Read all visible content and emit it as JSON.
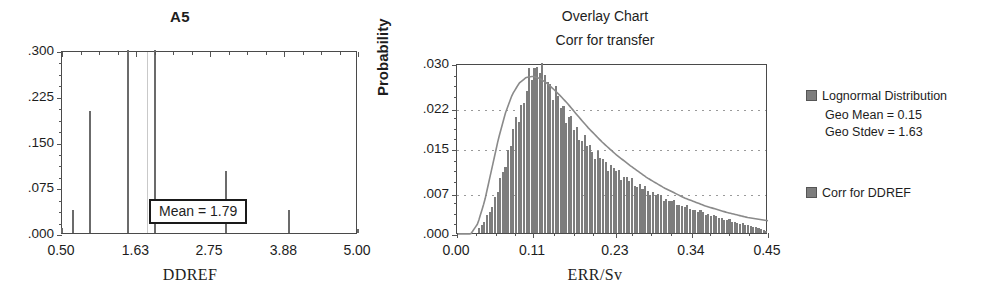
{
  "left_chart": {
    "title": "A5",
    "xlabel": "DDREF",
    "ytick_labels": [
      ".300",
      ".225",
      ".150",
      ".075",
      ".000"
    ],
    "xtick_labels": [
      "0.50",
      "1.63",
      "2.75",
      "3.88",
      "5.00"
    ],
    "annotation": "Mean = 1.79"
  },
  "right_chart": {
    "title": "Overlay Chart",
    "subtitle": "Corr for transfer",
    "ylabel": "Probability",
    "xlabel": "ERR/Sv",
    "ytick_labels": [
      ".030",
      ".022",
      ".015",
      ".007",
      ".000"
    ],
    "xtick_labels": [
      "0.00",
      "0.11",
      "0.23",
      "0.34",
      "0.45"
    ]
  },
  "legend": {
    "entry1_label": "Lognormal Distribution",
    "entry1_line2": "Geo Mean = 0.15",
    "entry1_line3": "Geo Stdev = 1.63",
    "entry2_label": "Corr for DDREF",
    "swatch_color": "#7d7d7d"
  },
  "chart_data": [
    {
      "type": "bar",
      "id": "A5-ddref",
      "title": "A5",
      "xlabel": "DDREF",
      "ylabel": "",
      "xlim": [
        0.5,
        5.0
      ],
      "ylim": [
        0.0,
        0.3
      ],
      "xticks": [
        0.5,
        1.63,
        2.75,
        3.88,
        5.0
      ],
      "yticks": [
        0.0,
        0.075,
        0.15,
        0.225,
        0.3
      ],
      "grid": false,
      "annotations": [
        "Mean = 1.79"
      ],
      "mean_line_x": 1.79,
      "categories": [
        0.5,
        0.67,
        0.92,
        1.5,
        1.92,
        3.0,
        3.95,
        5.0
      ],
      "values": [
        0.008,
        0.038,
        0.2,
        0.3,
        0.3,
        0.102,
        0.038,
        0.006
      ]
    },
    {
      "type": "area",
      "id": "overlay-err-per-sv",
      "title": "Overlay Chart",
      "subtitle": "Corr for transfer",
      "xlabel": "ERR/Sv",
      "ylabel": "Probability",
      "xlim": [
        0.0,
        0.45
      ],
      "ylim": [
        0.0,
        0.03
      ],
      "xticks": [
        0.0,
        0.11,
        0.23,
        0.34,
        0.45
      ],
      "yticks": [
        0.0,
        0.007,
        0.015,
        0.022,
        0.03
      ],
      "grid": true,
      "legend_position": "right",
      "series": [
        {
          "name": "Corr for DDREF",
          "kind": "histogram",
          "x": [
            0.03,
            0.038,
            0.045,
            0.052,
            0.059,
            0.066,
            0.072,
            0.078,
            0.084,
            0.09,
            0.096,
            0.101,
            0.106,
            0.111,
            0.116,
            0.121,
            0.126,
            0.131,
            0.137,
            0.143,
            0.15,
            0.158,
            0.167,
            0.177,
            0.188,
            0.2,
            0.213,
            0.227,
            0.242,
            0.258,
            0.275,
            0.293,
            0.312,
            0.332,
            0.353,
            0.375,
            0.398,
            0.42,
            0.44,
            0.45
          ],
          "values": [
            0.0005,
            0.0016,
            0.0031,
            0.005,
            0.0075,
            0.0103,
            0.0132,
            0.016,
            0.0186,
            0.021,
            0.0233,
            0.0253,
            0.0272,
            0.0288,
            0.0298,
            0.0296,
            0.0285,
            0.0272,
            0.0258,
            0.0244,
            0.0228,
            0.021,
            0.0192,
            0.0174,
            0.0157,
            0.0141,
            0.0126,
            0.0112,
            0.0099,
            0.0087,
            0.0076,
            0.0065,
            0.0055,
            0.0046,
            0.0037,
            0.0029,
            0.0021,
            0.0014,
            0.0007,
            0.0002
          ]
        },
        {
          "name": "Lognormal Distribution",
          "kind": "line",
          "geo_mean": 0.15,
          "geo_stdev": 1.63,
          "x": [
            0.02,
            0.03,
            0.04,
            0.05,
            0.06,
            0.07,
            0.08,
            0.09,
            0.1,
            0.11,
            0.12,
            0.13,
            0.14,
            0.15,
            0.16,
            0.175,
            0.19,
            0.21,
            0.23,
            0.25,
            0.275,
            0.3,
            0.33,
            0.36,
            0.39,
            0.42,
            0.45
          ],
          "values": [
            0.0002,
            0.002,
            0.006,
            0.0115,
            0.017,
            0.0215,
            0.0248,
            0.0268,
            0.0278,
            0.028,
            0.0276,
            0.0268,
            0.0257,
            0.0245,
            0.0232,
            0.021,
            0.0189,
            0.0164,
            0.0142,
            0.0123,
            0.0101,
            0.0083,
            0.0065,
            0.0051,
            0.004,
            0.0031,
            0.0025
          ]
        }
      ]
    }
  ]
}
